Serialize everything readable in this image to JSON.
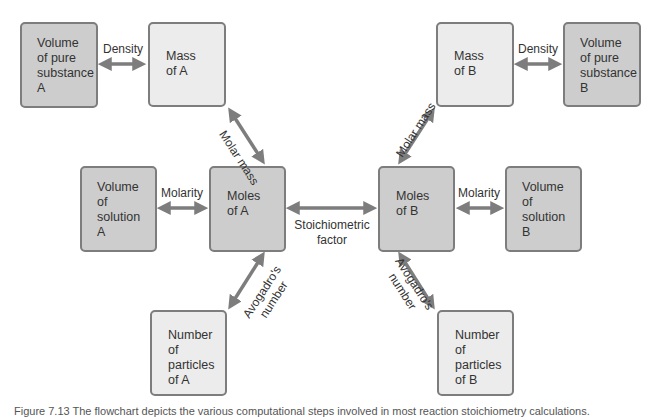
{
  "nodes": {
    "vol_pure_a": [
      "Volume",
      "of pure",
      "substance",
      "A"
    ],
    "mass_a": [
      "Mass",
      "of A"
    ],
    "mass_b": [
      "Mass",
      "of B"
    ],
    "vol_pure_b": [
      "Volume",
      "of pure",
      "substance",
      "B"
    ],
    "vol_sol_a": [
      "Volume",
      "of",
      "solution",
      "A"
    ],
    "moles_a": [
      "Moles",
      "of A"
    ],
    "moles_b": [
      "Moles",
      "of B"
    ],
    "vol_sol_b": [
      "Volume",
      "of",
      "solution",
      "B"
    ],
    "particles_a": [
      "Number",
      "of",
      "particles",
      "of A"
    ],
    "particles_b": [
      "Number",
      "of",
      "particles",
      "of B"
    ]
  },
  "edges": {
    "density_a": "Density",
    "density_b": "Density",
    "molar_mass_a": "Molar mass",
    "molar_mass_b": "Molar mass",
    "molarity_a": "Molarity",
    "molarity_b": "Molarity",
    "stoich": [
      "Stoichiometric",
      "factor"
    ],
    "avogadro_a": [
      "Avogadro's",
      "number"
    ],
    "avogadro_b": [
      "Avogadro's",
      "number"
    ]
  },
  "colors": {
    "arrow": "#7d7d7d",
    "dark_box": "#cdcdcd",
    "light_box": "#ececec"
  },
  "caption": "Figure 7.13 The flowchart depicts the various computational steps involved in most reaction stoichiometry calculations."
}
